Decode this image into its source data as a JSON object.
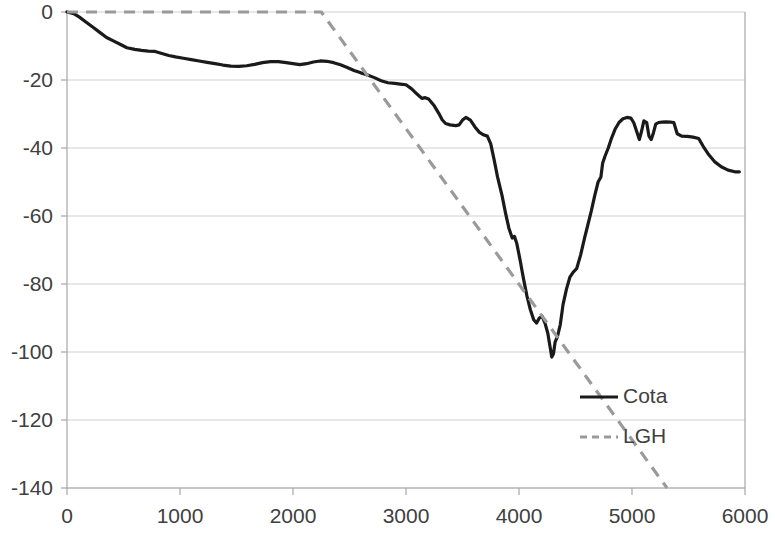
{
  "chart_data": {
    "type": "line",
    "title": "",
    "subtitle": "",
    "xlabel": "",
    "ylabel": "",
    "xlim": [
      0,
      6000
    ],
    "ylim": [
      -140,
      0
    ],
    "grid": true,
    "grid_axis": "y",
    "legend_position": "inside-right",
    "x_ticks": [
      0,
      1000,
      2000,
      3000,
      4000,
      5000,
      6000
    ],
    "x_tick_labels": [
      "0",
      "1000",
      "2000",
      "3000",
      "4000",
      "5000",
      "6000"
    ],
    "y_ticks": [
      0,
      -20,
      -40,
      -60,
      -80,
      -100,
      -120,
      -140
    ],
    "y_tick_labels": [
      "0",
      "-20",
      "-40",
      "-60",
      "-80",
      "-100",
      "-120",
      "-140"
    ],
    "colors": {
      "cota": "#1a1a1a",
      "lgh": "#9a9a9a",
      "grid": "#d0d0d0",
      "axis": "#a6a6a6",
      "text": "#404040",
      "background": "#ffffff"
    },
    "series": [
      {
        "name": "Cota",
        "style": "solid",
        "color": "#1a1a1a",
        "points": [
          [
            0,
            0
          ],
          [
            60,
            -0.5
          ],
          [
            110,
            -1.5
          ],
          [
            170,
            -3.0
          ],
          [
            230,
            -4.5
          ],
          [
            290,
            -6.0
          ],
          [
            350,
            -7.5
          ],
          [
            410,
            -8.5
          ],
          [
            470,
            -9.5
          ],
          [
            530,
            -10.5
          ],
          [
            600,
            -11.0
          ],
          [
            660,
            -11.3
          ],
          [
            720,
            -11.5
          ],
          [
            780,
            -11.6
          ],
          [
            840,
            -12.2
          ],
          [
            900,
            -12.8
          ],
          [
            960,
            -13.2
          ],
          [
            1030,
            -13.6
          ],
          [
            1100,
            -14.0
          ],
          [
            1170,
            -14.4
          ],
          [
            1240,
            -14.8
          ],
          [
            1310,
            -15.2
          ],
          [
            1380,
            -15.6
          ],
          [
            1450,
            -15.9
          ],
          [
            1520,
            -16.0
          ],
          [
            1590,
            -15.8
          ],
          [
            1660,
            -15.4
          ],
          [
            1730,
            -14.9
          ],
          [
            1800,
            -14.6
          ],
          [
            1870,
            -14.6
          ],
          [
            1940,
            -14.9
          ],
          [
            2000,
            -15.2
          ],
          [
            2060,
            -15.5
          ],
          [
            2120,
            -15.2
          ],
          [
            2180,
            -14.7
          ],
          [
            2240,
            -14.4
          ],
          [
            2300,
            -14.5
          ],
          [
            2360,
            -14.9
          ],
          [
            2420,
            -15.5
          ],
          [
            2480,
            -16.3
          ],
          [
            2540,
            -17.2
          ],
          [
            2600,
            -17.9
          ],
          [
            2660,
            -18.5
          ],
          [
            2720,
            -19.3
          ],
          [
            2780,
            -20.2
          ],
          [
            2840,
            -20.8
          ],
          [
            2900,
            -21.0
          ],
          [
            2950,
            -21.2
          ],
          [
            3000,
            -21.4
          ],
          [
            3050,
            -22.6
          ],
          [
            3100,
            -24.2
          ],
          [
            3140,
            -25.4
          ],
          [
            3170,
            -25.2
          ],
          [
            3200,
            -25.6
          ],
          [
            3250,
            -27.6
          ],
          [
            3290,
            -29.8
          ],
          [
            3320,
            -31.7
          ],
          [
            3350,
            -32.8
          ],
          [
            3390,
            -33.2
          ],
          [
            3440,
            -33.4
          ],
          [
            3470,
            -33.2
          ],
          [
            3500,
            -31.8
          ],
          [
            3530,
            -31.0
          ],
          [
            3570,
            -31.8
          ],
          [
            3610,
            -33.8
          ],
          [
            3650,
            -35.4
          ],
          [
            3690,
            -36.2
          ],
          [
            3720,
            -36.5
          ],
          [
            3750,
            -38.8
          ],
          [
            3780,
            -43.5
          ],
          [
            3810,
            -48.5
          ],
          [
            3850,
            -54.0
          ],
          [
            3880,
            -59.0
          ],
          [
            3910,
            -63.5
          ],
          [
            3940,
            -66.5
          ],
          [
            3960,
            -66.0
          ],
          [
            3980,
            -68.0
          ],
          [
            4010,
            -73.0
          ],
          [
            4040,
            -78.5
          ],
          [
            4070,
            -83.5
          ],
          [
            4100,
            -87.5
          ],
          [
            4130,
            -90.5
          ],
          [
            4155,
            -91.5
          ],
          [
            4180,
            -90.0
          ],
          [
            4205,
            -89.5
          ],
          [
            4230,
            -91.5
          ],
          [
            4255,
            -94.5
          ],
          [
            4275,
            -98.5
          ],
          [
            4290,
            -101.5
          ],
          [
            4305,
            -100.5
          ],
          [
            4320,
            -97.0
          ],
          [
            4340,
            -95.5
          ],
          [
            4365,
            -92.0
          ],
          [
            4390,
            -86.0
          ],
          [
            4420,
            -81.5
          ],
          [
            4450,
            -78.0
          ],
          [
            4480,
            -76.5
          ],
          [
            4510,
            -75.5
          ],
          [
            4545,
            -71.5
          ],
          [
            4580,
            -66.5
          ],
          [
            4610,
            -62.5
          ],
          [
            4640,
            -58.5
          ],
          [
            4670,
            -54.0
          ],
          [
            4700,
            -50.0
          ],
          [
            4725,
            -48.5
          ],
          [
            4740,
            -44.5
          ],
          [
            4760,
            -42.5
          ],
          [
            4790,
            -40.0
          ],
          [
            4820,
            -37.0
          ],
          [
            4850,
            -34.5
          ],
          [
            4885,
            -32.5
          ],
          [
            4920,
            -31.4
          ],
          [
            4955,
            -31.0
          ],
          [
            4990,
            -31.2
          ],
          [
            5015,
            -32.5
          ],
          [
            5040,
            -35.0
          ],
          [
            5065,
            -37.5
          ],
          [
            5085,
            -35.0
          ],
          [
            5105,
            -32.0
          ],
          [
            5130,
            -32.5
          ],
          [
            5150,
            -36.5
          ],
          [
            5170,
            -37.5
          ],
          [
            5190,
            -35.5
          ],
          [
            5210,
            -33.0
          ],
          [
            5235,
            -32.5
          ],
          [
            5265,
            -32.4
          ],
          [
            5300,
            -32.3
          ],
          [
            5340,
            -32.4
          ],
          [
            5370,
            -32.5
          ],
          [
            5400,
            -35.8
          ],
          [
            5440,
            -36.5
          ],
          [
            5490,
            -36.6
          ],
          [
            5540,
            -36.8
          ],
          [
            5590,
            -37.2
          ],
          [
            5630,
            -39.5
          ],
          [
            5680,
            -42.0
          ],
          [
            5730,
            -44.0
          ],
          [
            5790,
            -45.5
          ],
          [
            5850,
            -46.5
          ],
          [
            5910,
            -47.0
          ],
          [
            5950,
            -47.0
          ]
        ]
      },
      {
        "name": "LGH",
        "style": "dashed",
        "color": "#9a9a9a",
        "points": [
          [
            0,
            0
          ],
          [
            2250,
            0
          ],
          [
            5310,
            -140
          ]
        ]
      }
    ],
    "legend": [
      {
        "label": "Cota",
        "style": "solid",
        "color": "#1a1a1a"
      },
      {
        "label": "LGH",
        "style": "dashed",
        "color": "#9a9a9a"
      }
    ]
  }
}
